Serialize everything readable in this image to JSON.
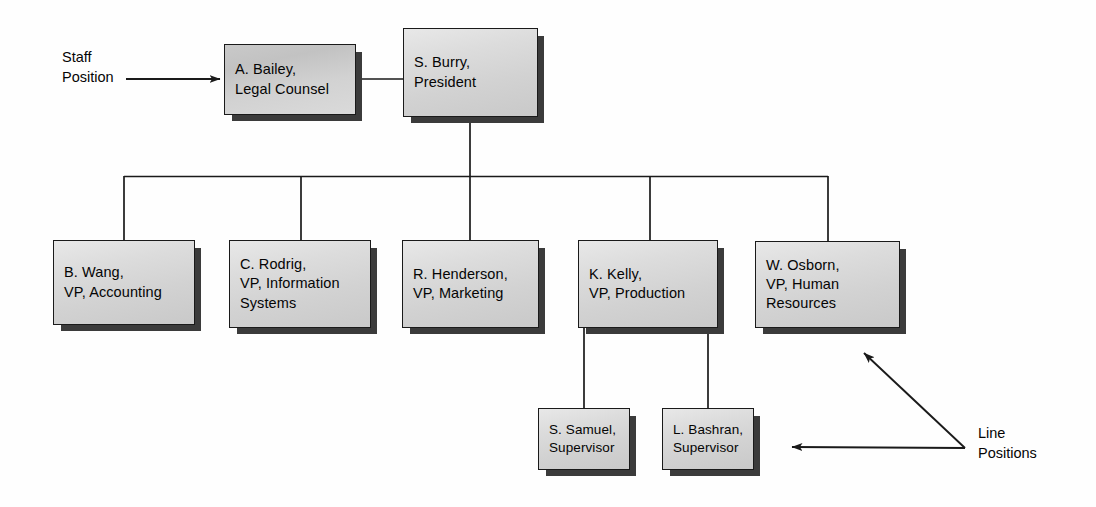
{
  "diagram": {
    "type": "org-chart",
    "background_color": "#fefefe",
    "box_fill_color": "#d6d6d6",
    "box_shaded_fill_color": "#c6c6c6",
    "box_border_color": "#1a1a1a",
    "box_shadow_color": "#3b3b3b",
    "connector_color": "#1a1a1a",
    "text_color": "#050505"
  },
  "nodes": {
    "staff": {
      "id": "a-bailey",
      "name": "A. Bailey,",
      "role": "Legal Counsel",
      "label": "A. Bailey,\nLegal Counsel",
      "x": 224,
      "y": 44,
      "w": 132,
      "h": 71,
      "shaded": true
    },
    "president": {
      "id": "s-burry",
      "name": "S. Burry,",
      "role": "President",
      "label": "S. Burry,\nPresident",
      "x": 403,
      "y": 28,
      "w": 135,
      "h": 89,
      "shaded": false
    },
    "vps": [
      {
        "id": "b-wang",
        "name": "B. Wang,",
        "role": "VP, Accounting",
        "label": "B. Wang,\nVP, Accounting",
        "x": 53,
        "y": 240,
        "w": 142,
        "h": 85,
        "drop_x": 124
      },
      {
        "id": "c-rodrig",
        "name": "C. Rodrig,",
        "role": "VP, Information Systems",
        "label": "C. Rodrig,\nVP, Information\nSystems",
        "x": 229,
        "y": 240,
        "w": 142,
        "h": 88,
        "drop_x": 301
      },
      {
        "id": "r-henderson",
        "name": "R. Henderson,",
        "role": "VP, Marketing",
        "label": "R. Henderson,\nVP, Marketing",
        "x": 402,
        "y": 240,
        "w": 137,
        "h": 88,
        "drop_x": 470
      },
      {
        "id": "k-kelly",
        "name": "K. Kelly,",
        "role": "VP, Production",
        "label": "K. Kelly,\nVP, Production",
        "x": 578,
        "y": 240,
        "w": 140,
        "h": 88,
        "drop_x": 650
      },
      {
        "id": "w-osborn",
        "name": "W. Osborn,",
        "role": "VP, Human Resources",
        "label": "W. Osborn,\nVP, Human\nResources",
        "x": 755,
        "y": 241,
        "w": 145,
        "h": 87,
        "drop_x": 828
      }
    ],
    "supervisors": [
      {
        "id": "s-samuel",
        "name": "S. Samuel,",
        "role": "Supervisor",
        "label": "S. Samuel,\nSupervisor",
        "x": 538,
        "y": 408,
        "w": 92,
        "h": 62,
        "drop_x": 584,
        "parent": "k-kelly"
      },
      {
        "id": "l-bashran",
        "name": "L. Bashran,",
        "role": "Supervisor",
        "label": "L. Bashran,\nSupervisor",
        "x": 662,
        "y": 408,
        "w": 92,
        "h": 62,
        "drop_x": 708,
        "parent": "k-kelly"
      }
    ]
  },
  "annotations": {
    "staff_position": {
      "label": "Staff\nPosition",
      "x": 62,
      "y": 48,
      "arrow_from_x": 126,
      "arrow_from_y": 79,
      "arrow_to_x": 221,
      "arrow_to_y": 79
    },
    "line_positions": {
      "label": "Line\nPositions",
      "x": 978,
      "y": 424,
      "junction_x": 965,
      "junction_y": 448,
      "arrow1_to_x": 862,
      "arrow1_to_y": 352,
      "arrow2_to_x": 790,
      "arrow2_to_y": 447
    }
  },
  "connectors": {
    "president_to_staff": {
      "x1": 356,
      "y1": 79,
      "x2": 403,
      "y2": 79
    },
    "president_stem": {
      "x1": 470,
      "y1": 117,
      "x2": 470,
      "y2": 176
    },
    "bus": {
      "x1": 124,
      "y1": 176,
      "x2": 828,
      "y2": 176
    },
    "bus_y": 176,
    "vp_top_y": 240,
    "kelly_bottom_y": 328,
    "supervisor_top_y": 408
  }
}
